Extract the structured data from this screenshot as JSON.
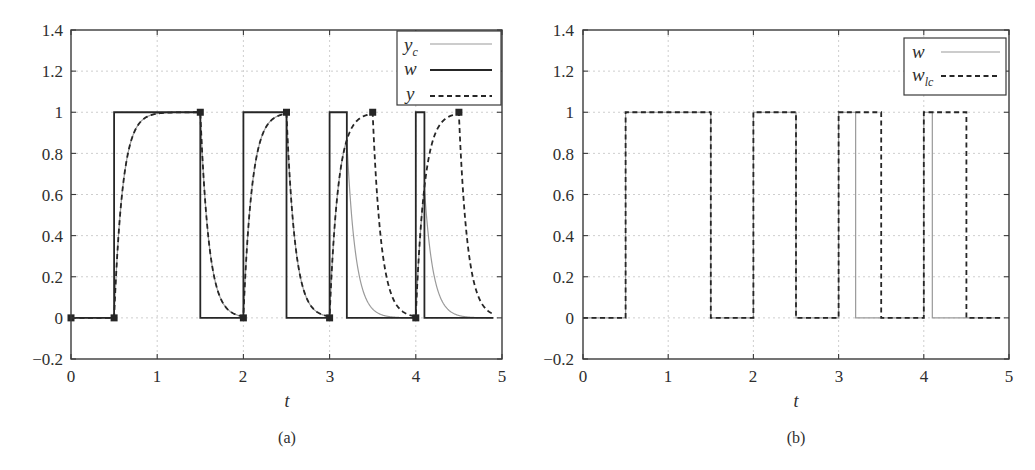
{
  "figure": {
    "panels": [
      {
        "id": "a",
        "caption": "(a)",
        "xlabel": "t",
        "xticks": [
          "0",
          "1",
          "2",
          "3",
          "4",
          "5"
        ],
        "yticks": [
          "−0.2",
          "0",
          "0.2",
          "0.4",
          "0.6",
          "0.8",
          "1",
          "1.2",
          "1.4"
        ],
        "legend": [
          {
            "label": "y",
            "sub": "c",
            "style": "thin-gray"
          },
          {
            "label": "w",
            "sub": "",
            "style": "solid-black"
          },
          {
            "label": "y",
            "sub": "",
            "style": "dashed-black"
          }
        ]
      },
      {
        "id": "b",
        "caption": "(b)",
        "xlabel": "t",
        "xticks": [
          "0",
          "1",
          "2",
          "3",
          "4",
          "5"
        ],
        "yticks": [
          "−0.2",
          "0",
          "0.2",
          "0.4",
          "0.6",
          "0.8",
          "1",
          "1.2",
          "1.4"
        ],
        "legend": [
          {
            "label": "w",
            "sub": "",
            "style": "thin-gray"
          },
          {
            "label": "w",
            "sub": "lc",
            "style": "dashed-black"
          }
        ]
      }
    ],
    "colors": {
      "black_line": "#262626",
      "gray_line": "#9a9a9a",
      "grid": "#c8c8c8",
      "frame": "#3a3a3a"
    }
  },
  "chart_data": [
    {
      "type": "line",
      "title": "(a)",
      "xlabel": "t",
      "ylabel": "",
      "xlim": [
        0,
        5
      ],
      "ylim": [
        -0.2,
        1.4
      ],
      "xticks": [
        0,
        1,
        2,
        3,
        4,
        5
      ],
      "yticks": [
        -0.2,
        0,
        0.2,
        0.4,
        0.6,
        0.8,
        1,
        1.2,
        1.4
      ],
      "grid": true,
      "legend_position": "upper right",
      "time_constant": 0.1,
      "t_end": 4.9,
      "series": [
        {
          "name": "y_c",
          "style": "thin gray solid",
          "kind": "first-order response to w",
          "input_steps": [
            [
              0,
              0
            ],
            [
              0.5,
              1
            ],
            [
              1.5,
              0
            ],
            [
              2,
              1
            ],
            [
              2.5,
              0
            ],
            [
              3,
              1
            ],
            [
              3.2,
              0
            ],
            [
              4,
              1
            ],
            [
              4.1,
              0
            ]
          ],
          "x": [
            0,
            0.5,
            0.6,
            0.7,
            0.8,
            0.9,
            1.0,
            1.5,
            1.6,
            1.7,
            1.8,
            1.9,
            2.0,
            2.1,
            2.2,
            2.3,
            2.4,
            2.5,
            2.6,
            2.7,
            2.8,
            2.9,
            3.0,
            3.1,
            3.2,
            3.3,
            3.4,
            3.5,
            3.6,
            3.8,
            4.0,
            4.1,
            4.2,
            4.3,
            4.4,
            4.5,
            4.7,
            4.9
          ],
          "values": [
            0,
            0,
            0.632,
            0.865,
            0.95,
            0.982,
            0.993,
            1.0,
            0.368,
            0.135,
            0.05,
            0.018,
            0.007,
            0.634,
            0.865,
            0.95,
            0.982,
            0.993,
            0.365,
            0.134,
            0.049,
            0.018,
            0.007,
            0.634,
            0.865,
            0.318,
            0.117,
            0.043,
            0.016,
            0.002,
            0.0,
            0.632,
            0.233,
            0.086,
            0.031,
            0.012,
            0.002,
            0.0
          ]
        },
        {
          "name": "w",
          "style": "solid black",
          "kind": "step",
          "input_steps": [
            [
              0,
              0
            ],
            [
              0.5,
              1
            ],
            [
              1.5,
              0
            ],
            [
              2,
              1
            ],
            [
              2.5,
              0
            ],
            [
              3,
              1
            ],
            [
              3.2,
              0
            ],
            [
              4,
              1
            ],
            [
              4.1,
              0
            ]
          ]
        },
        {
          "name": "y",
          "style": "dashed black with square markers",
          "kind": "first-order response to w_lc",
          "input_steps": [
            [
              0,
              0
            ],
            [
              0.5,
              1
            ],
            [
              1.5,
              0
            ],
            [
              2,
              1
            ],
            [
              2.5,
              0
            ],
            [
              3,
              1
            ],
            [
              3.5,
              0
            ],
            [
              4,
              1
            ],
            [
              4.5,
              0
            ]
          ],
          "markers": [
            [
              0,
              0
            ],
            [
              0.5,
              0
            ],
            [
              1.5,
              1
            ],
            [
              2,
              0
            ],
            [
              2.5,
              1
            ],
            [
              3,
              0
            ],
            [
              3.5,
              1
            ],
            [
              4,
              0
            ],
            [
              4.5,
              1
            ]
          ],
          "x": [
            0,
            0.5,
            0.6,
            0.7,
            0.8,
            0.9,
            1.0,
            1.5,
            1.6,
            1.7,
            1.8,
            1.9,
            2.0,
            2.1,
            2.2,
            2.3,
            2.4,
            2.5,
            2.6,
            2.7,
            2.8,
            2.9,
            3.0,
            3.1,
            3.2,
            3.3,
            3.4,
            3.5,
            3.6,
            3.7,
            3.8,
            3.9,
            4.0,
            4.1,
            4.2,
            4.3,
            4.4,
            4.5,
            4.6,
            4.7,
            4.8,
            4.9
          ],
          "values": [
            0,
            0,
            0.632,
            0.865,
            0.95,
            0.982,
            0.993,
            1.0,
            0.368,
            0.135,
            0.05,
            0.018,
            0.007,
            0.634,
            0.865,
            0.95,
            0.982,
            0.993,
            0.365,
            0.134,
            0.049,
            0.018,
            0.007,
            0.634,
            0.865,
            0.95,
            0.982,
            0.993,
            0.365,
            0.134,
            0.049,
            0.018,
            0.007,
            0.634,
            0.865,
            0.95,
            0.982,
            0.993,
            0.365,
            0.134,
            0.049,
            0.018
          ]
        }
      ]
    },
    {
      "type": "line",
      "title": "(b)",
      "xlabel": "t",
      "ylabel": "",
      "xlim": [
        0,
        5
      ],
      "ylim": [
        -0.2,
        1.4
      ],
      "xticks": [
        0,
        1,
        2,
        3,
        4,
        5
      ],
      "yticks": [
        -0.2,
        0,
        0.2,
        0.4,
        0.6,
        0.8,
        1,
        1.2,
        1.4
      ],
      "grid": true,
      "legend_position": "upper right",
      "t_end": 4.9,
      "series": [
        {
          "name": "w",
          "style": "thin gray solid",
          "kind": "step",
          "input_steps": [
            [
              0,
              0
            ],
            [
              0.5,
              1
            ],
            [
              1.5,
              0
            ],
            [
              2,
              1
            ],
            [
              2.5,
              0
            ],
            [
              3,
              1
            ],
            [
              3.2,
              0
            ],
            [
              4,
              1
            ],
            [
              4.1,
              0
            ]
          ]
        },
        {
          "name": "w_lc",
          "style": "dashed black",
          "kind": "step",
          "input_steps": [
            [
              0,
              0
            ],
            [
              0.5,
              1
            ],
            [
              1.5,
              0
            ],
            [
              2,
              1
            ],
            [
              2.5,
              0
            ],
            [
              3,
              1
            ],
            [
              3.5,
              0
            ],
            [
              4,
              1
            ],
            [
              4.5,
              0
            ]
          ]
        }
      ]
    }
  ]
}
